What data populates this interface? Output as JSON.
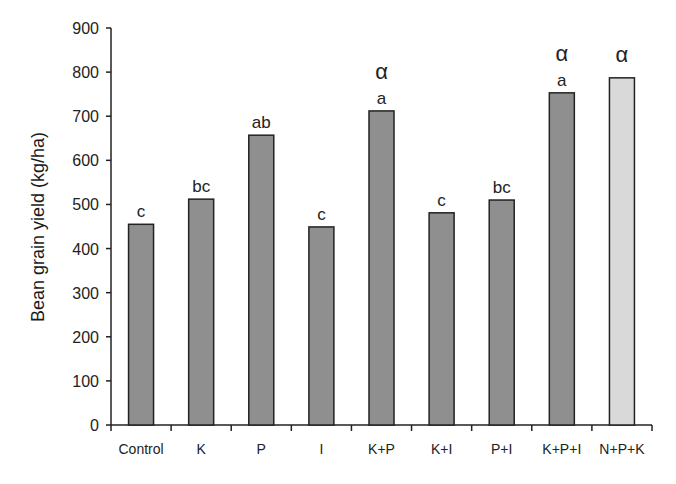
{
  "chart_data": {
    "type": "bar",
    "title": "",
    "xlabel": "",
    "ylabel": "Bean grain yield (kg/ha)",
    "ylim": [
      0,
      900
    ],
    "yticks": [
      0,
      100,
      200,
      300,
      400,
      500,
      600,
      700,
      800,
      900
    ],
    "grid": false,
    "legend": null,
    "categories": [
      "Control",
      "K",
      "P",
      "I",
      "K+P",
      "K+I",
      "P+I",
      "K+P+I",
      "N+P+K"
    ],
    "values": [
      455,
      512,
      657,
      449,
      712,
      481,
      510,
      753,
      787
    ],
    "significance_letters": [
      "c",
      "bc",
      "ab",
      "c",
      "a",
      "c",
      "bc",
      "a",
      ""
    ],
    "alpha_markers": [
      false,
      false,
      false,
      false,
      true,
      false,
      false,
      true,
      true
    ],
    "alpha_symbol": "α",
    "bar_colors": [
      "#8f8f8f",
      "#8f8f8f",
      "#8f8f8f",
      "#8f8f8f",
      "#8f8f8f",
      "#8f8f8f",
      "#8f8f8f",
      "#8f8f8f",
      "#d9d9d9"
    ]
  }
}
